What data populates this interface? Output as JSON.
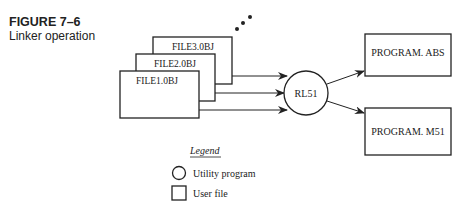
{
  "caption": {
    "number": "FIGURE 7–6",
    "title": "Linker operation"
  },
  "diagram": {
    "input_files": [
      "FILE1.0BJ",
      "FILE2.0BJ",
      "FILE3.0BJ"
    ],
    "continuation": "more files (ellipsis dots)",
    "utility": "RL51",
    "outputs": [
      "PROGRAM. ABS",
      "PROGRAM. M51"
    ]
  },
  "legend": {
    "title": "Legend",
    "items": [
      {
        "shape": "circle",
        "label": "Utility program"
      },
      {
        "shape": "square",
        "label": "User file"
      }
    ]
  },
  "colors": {
    "stroke": "#222222",
    "background": "#ffffff"
  }
}
